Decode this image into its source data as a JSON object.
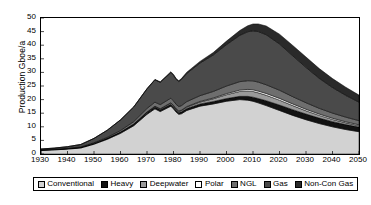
{
  "chart_data": {
    "type": "area",
    "stacked": true,
    "title": "",
    "xlabel": "",
    "ylabel": "Production Gboe/a",
    "xlim": [
      1930,
      2050
    ],
    "ylim": [
      0,
      50
    ],
    "ytick_step": 5,
    "xtick_step": 10,
    "grid": false,
    "legend_position": "bottom",
    "x": [
      1930,
      1935,
      1940,
      1945,
      1950,
      1955,
      1960,
      1965,
      1970,
      1973,
      1975,
      1979,
      1980,
      1981,
      1982,
      1983,
      1985,
      1990,
      1995,
      2000,
      2005,
      2008,
      2010,
      2012,
      2015,
      2020,
      2025,
      2030,
      2035,
      2040,
      2045,
      2050
    ],
    "xtick_labels": [
      "1930",
      "1940",
      "1950",
      "1960",
      "1970",
      "1980",
      "1990",
      "2000",
      "2010",
      "2020",
      "2030",
      "2040",
      "2050"
    ],
    "ytick_labels": [
      "0",
      "5",
      "10",
      "15",
      "20",
      "25",
      "30",
      "35",
      "40",
      "45",
      "50"
    ],
    "series": [
      {
        "name": "Conventional",
        "color": "#d2d2d2",
        "values": [
          1.3,
          1.5,
          1.8,
          2.2,
          3.6,
          5.4,
          7.6,
          10.4,
          14.6,
          16.6,
          15.6,
          17.6,
          16.6,
          15.4,
          14.6,
          14.8,
          16.0,
          17.6,
          18.4,
          19.4,
          20.0,
          19.8,
          19.4,
          18.8,
          17.8,
          16.0,
          14.2,
          12.6,
          11.2,
          10.0,
          9.0,
          8.2
        ]
      },
      {
        "name": "Heavy",
        "color": "#121212",
        "values": [
          0.2,
          0.2,
          0.2,
          0.25,
          0.3,
          0.35,
          0.4,
          0.5,
          0.6,
          0.65,
          0.65,
          0.7,
          0.7,
          0.7,
          0.7,
          0.7,
          0.75,
          0.8,
          0.9,
          1.0,
          1.2,
          1.4,
          1.5,
          1.6,
          1.8,
          2.0,
          2.1,
          2.1,
          2.0,
          1.9,
          1.8,
          1.7
        ]
      },
      {
        "name": "Deepwater",
        "color": "#9a9a9a",
        "values": [
          0.0,
          0.0,
          0.0,
          0.0,
          0.0,
          0.0,
          0.05,
          0.1,
          0.2,
          0.25,
          0.3,
          0.4,
          0.4,
          0.4,
          0.4,
          0.45,
          0.5,
          0.7,
          1.0,
          1.4,
          1.8,
          2.0,
          2.1,
          2.1,
          2.0,
          1.8,
          1.5,
          1.2,
          1.0,
          0.8,
          0.65,
          0.5
        ]
      },
      {
        "name": "Polar",
        "color": "#ffffff",
        "values": [
          0.0,
          0.0,
          0.0,
          0.0,
          0.0,
          0.0,
          0.0,
          0.0,
          0.05,
          0.08,
          0.1,
          0.15,
          0.15,
          0.15,
          0.15,
          0.18,
          0.2,
          0.25,
          0.3,
          0.4,
          0.5,
          0.55,
          0.6,
          0.62,
          0.65,
          0.65,
          0.6,
          0.55,
          0.5,
          0.45,
          0.4,
          0.35
        ]
      },
      {
        "name": "NGL",
        "color": "#6e6e6e",
        "values": [
          0.05,
          0.07,
          0.1,
          0.15,
          0.25,
          0.4,
          0.6,
          0.9,
          1.3,
          1.5,
          1.5,
          1.7,
          1.7,
          1.6,
          1.6,
          1.65,
          1.8,
          2.1,
          2.4,
          2.8,
          3.1,
          3.2,
          3.3,
          3.3,
          3.2,
          3.0,
          2.7,
          2.4,
          2.1,
          1.9,
          1.7,
          1.5
        ]
      },
      {
        "name": "Gas",
        "color": "#4a4a4a",
        "values": [
          0.3,
          0.4,
          0.6,
          0.9,
          1.6,
          2.6,
          3.9,
          5.4,
          7.2,
          8.2,
          8.2,
          9.4,
          9.4,
          9.2,
          9.2,
          9.6,
          10.4,
          12.0,
          13.4,
          15.2,
          17.0,
          18.0,
          18.4,
          18.6,
          18.4,
          17.0,
          15.0,
          13.0,
          11.0,
          9.4,
          8.0,
          6.8
        ]
      },
      {
        "name": "Non-Con Gas",
        "color": "#2a2a2a",
        "values": [
          0.0,
          0.0,
          0.0,
          0.0,
          0.0,
          0.0,
          0.0,
          0.05,
          0.1,
          0.15,
          0.2,
          0.3,
          0.3,
          0.3,
          0.3,
          0.35,
          0.4,
          0.6,
          0.9,
          1.3,
          1.8,
          2.2,
          2.5,
          2.8,
          3.2,
          3.6,
          3.8,
          3.8,
          3.6,
          3.3,
          3.0,
          2.6
        ]
      }
    ],
    "totals_note": "stack peaks near 2012 at about 47 Gboe/a and declines to about 22 by 2050"
  },
  "legend": {
    "items": [
      {
        "label": "Conventional",
        "color": "#d2d2d2"
      },
      {
        "label": "Heavy",
        "color": "#121212"
      },
      {
        "label": "Deepwater",
        "color": "#9a9a9a"
      },
      {
        "label": "Polar",
        "color": "#ffffff"
      },
      {
        "label": "NGL",
        "color": "#6e6e6e"
      },
      {
        "label": "Gas",
        "color": "#4a4a4a"
      },
      {
        "label": "Non-Con Gas",
        "color": "#2a2a2a"
      }
    ]
  }
}
